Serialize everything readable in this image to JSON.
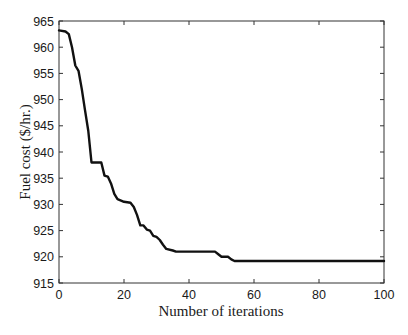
{
  "chart_data": {
    "type": "line",
    "title": "",
    "xlabel": "Number of iterations",
    "ylabel": "Fuel cost ($/hr.)",
    "xlim": [
      0,
      100
    ],
    "ylim": [
      915,
      965
    ],
    "xticks": [
      0,
      20,
      40,
      60,
      80,
      100
    ],
    "yticks": [
      915,
      920,
      925,
      930,
      935,
      940,
      945,
      950,
      955,
      960,
      965
    ],
    "grid": false,
    "legend": null,
    "series": [
      {
        "name": "Fuel cost",
        "color": "#111111",
        "x": [
          0,
          2,
          3,
          4,
          5,
          6,
          7,
          8,
          9,
          10,
          13,
          14,
          15,
          16,
          17,
          18,
          20,
          22,
          23,
          24,
          25,
          26,
          27,
          28,
          29,
          30,
          31,
          32,
          33,
          35,
          36,
          48,
          49,
          50,
          52,
          53,
          54,
          100
        ],
        "y": [
          963.2,
          963.0,
          962.5,
          960.0,
          956.5,
          955.5,
          952.0,
          948.0,
          944.0,
          938.0,
          938.0,
          935.5,
          935.3,
          934.0,
          932.0,
          931.0,
          930.5,
          930.3,
          929.5,
          928.0,
          926.0,
          926.0,
          925.2,
          925.0,
          924.0,
          923.8,
          923.2,
          922.3,
          921.5,
          921.2,
          921.0,
          921.0,
          920.5,
          920.0,
          920.0,
          919.5,
          919.2,
          919.2
        ]
      }
    ]
  }
}
